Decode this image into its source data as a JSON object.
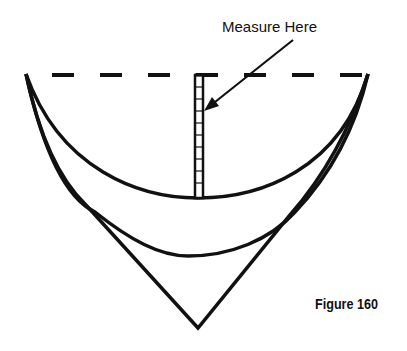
{
  "diagram": {
    "annotation": "Measure Here",
    "caption": "Figure 160",
    "colors": {
      "stroke": "#111111",
      "background": "#ffffff"
    },
    "elements": [
      "dashed-reference-line",
      "measurement-ruler",
      "pointer-arrow",
      "upper-curve",
      "middle-curve",
      "v-point-outline"
    ]
  }
}
